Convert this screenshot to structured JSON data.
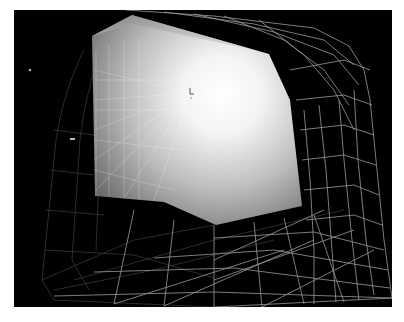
{
  "scene": {
    "type": "3d-render",
    "description": "shaded bent surface inside wireframe cage",
    "background_color": "#000000",
    "page_color": "#ffffff",
    "surface": {
      "highlight_color": "#ffffff",
      "shadow_color": "#6e6e6e",
      "outline": [
        [
          118,
          5
        ],
        [
          255,
          44
        ],
        [
          276,
          90
        ],
        [
          288,
          196
        ],
        [
          202,
          215
        ],
        [
          81,
          186
        ],
        [
          78,
          26
        ]
      ]
    },
    "wireframe": {
      "color": "#9a9a9a",
      "outer_cage": [
        [
          112,
          0
        ],
        [
          300,
          18
        ],
        [
          340,
          40
        ],
        [
          360,
          90
        ],
        [
          378,
          288
        ],
        [
          200,
          297
        ],
        [
          40,
          292
        ],
        [
          20,
          260
        ],
        [
          40,
          120
        ],
        [
          70,
          40
        ]
      ]
    },
    "marker": {
      "icon": "axis-cursor-icon",
      "x": 177,
      "y": 83
    },
    "small_point_markers": [
      {
        "x": 16,
        "y": 60
      },
      {
        "x": 58,
        "y": 129
      }
    ]
  }
}
